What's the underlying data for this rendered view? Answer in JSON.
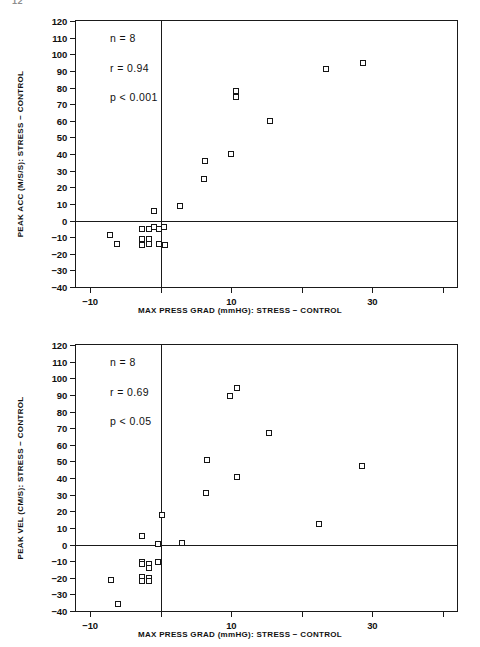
{
  "page_mark": "12",
  "charts": [
    {
      "id": "peak-acc-scatter",
      "chart_data": {
        "type": "scatter",
        "title": "",
        "xlabel": "MAX PRESS GRAD (mmHG): STRESS − CONTROL",
        "ylabel": "PEAK ACC (M/S/S): STRESS − CONTROL",
        "xlim": [
          -12,
          42
        ],
        "ylim": [
          -40,
          120
        ],
        "xticks": [
          -10,
          0,
          10,
          20,
          30,
          40
        ],
        "xticklabels": [
          "-10",
          "",
          "10",
          "",
          "30",
          ""
        ],
        "yticks": [
          -40,
          -30,
          -20,
          -10,
          0,
          10,
          20,
          30,
          40,
          50,
          60,
          70,
          80,
          90,
          100,
          110,
          120
        ],
        "yticklabels": [
          "-40",
          "-30",
          "-20",
          "-10",
          "0",
          "10",
          "20",
          "30",
          "40",
          "50",
          "60",
          "70",
          "80",
          "90",
          "100",
          "110",
          "120"
        ],
        "grid": false,
        "legend": null,
        "marker": "open-square",
        "zero_lines": {
          "horizontal": 0,
          "vertical": 0
        },
        "annotations": [
          "n = 8",
          "r = 0.94",
          "p < 0.001"
        ],
        "points": [
          {
            "x": -7.2,
            "y": -9
          },
          {
            "x": -6.2,
            "y": -14
          },
          {
            "x": -2.6,
            "y": -5
          },
          {
            "x": -2.6,
            "y": -11
          },
          {
            "x": -2.6,
            "y": -14
          },
          {
            "x": -2.6,
            "y": -15
          },
          {
            "x": -1.6,
            "y": -5
          },
          {
            "x": -1.6,
            "y": -11
          },
          {
            "x": -1.6,
            "y": -14
          },
          {
            "x": -0.9,
            "y": -4
          },
          {
            "x": -0.9,
            "y": 6
          },
          {
            "x": -0.3,
            "y": -5
          },
          {
            "x": -0.3,
            "y": -14
          },
          {
            "x": 0.5,
            "y": -4
          },
          {
            "x": 0.6,
            "y": -15
          },
          {
            "x": 2.8,
            "y": 8.5
          },
          {
            "x": 6.2,
            "y": 25
          },
          {
            "x": 6.3,
            "y": 36
          },
          {
            "x": 10.0,
            "y": 40
          },
          {
            "x": 10.7,
            "y": 74
          },
          {
            "x": 10.7,
            "y": 78
          },
          {
            "x": 15.5,
            "y": 60
          },
          {
            "x": 23.5,
            "y": 91
          },
          {
            "x": 28.7,
            "y": 95
          }
        ]
      },
      "stats": {
        "n": "n = 8",
        "r": "r = 0.94",
        "p": "p < 0.001"
      }
    },
    {
      "id": "peak-vel-scatter",
      "chart_data": {
        "type": "scatter",
        "title": "",
        "xlabel": "MAX PRESS GRAD (mmHG): STRESS − CONTROL",
        "ylabel": "PEAK VEL (CM/S): STRESS − CONTROL",
        "xlim": [
          -12,
          42
        ],
        "ylim": [
          -40,
          120
        ],
        "xticks": [
          -10,
          0,
          10,
          20,
          30,
          40
        ],
        "xticklabels": [
          "-10",
          "",
          "10",
          "",
          "30",
          ""
        ],
        "yticks": [
          -40,
          -30,
          -20,
          -10,
          0,
          10,
          20,
          30,
          40,
          50,
          60,
          70,
          80,
          90,
          100,
          110,
          120
        ],
        "yticklabels": [
          "-40",
          "-30",
          "-20",
          "-10",
          "0",
          "10",
          "20",
          "30",
          "40",
          "50",
          "60",
          "70",
          "80",
          "90",
          "100",
          "110",
          "120"
        ],
        "grid": false,
        "legend": null,
        "marker": "open-square",
        "zero_lines": {
          "horizontal": 0,
          "vertical": 0
        },
        "annotations": [
          "n = 8",
          "r = 0.69",
          "p < 0.05"
        ],
        "points": [
          {
            "x": -7.0,
            "y": -21.5
          },
          {
            "x": -6.0,
            "y": -35.5
          },
          {
            "x": -2.7,
            "y": -10.5
          },
          {
            "x": -2.7,
            "y": -12
          },
          {
            "x": -2.7,
            "y": -19.5
          },
          {
            "x": -2.7,
            "y": -22
          },
          {
            "x": -1.6,
            "y": -12
          },
          {
            "x": -1.6,
            "y": -14
          },
          {
            "x": -1.6,
            "y": -20
          },
          {
            "x": -1.6,
            "y": -22
          },
          {
            "x": -2.6,
            "y": 5
          },
          {
            "x": -0.4,
            "y": 0.5
          },
          {
            "x": -0.4,
            "y": -10.5
          },
          {
            "x": 0.2,
            "y": 18
          },
          {
            "x": 3.0,
            "y": 1
          },
          {
            "x": 6.4,
            "y": 31
          },
          {
            "x": 6.5,
            "y": 51
          },
          {
            "x": 9.8,
            "y": 89.5
          },
          {
            "x": 10.8,
            "y": 94
          },
          {
            "x": 10.8,
            "y": 40.5
          },
          {
            "x": 15.3,
            "y": 67
          },
          {
            "x": 22.5,
            "y": 12.5
          },
          {
            "x": 28.6,
            "y": 47
          }
        ]
      },
      "stats": {
        "n": "n = 8",
        "r": "r = 0.69",
        "p": "p < 0.05"
      }
    }
  ]
}
